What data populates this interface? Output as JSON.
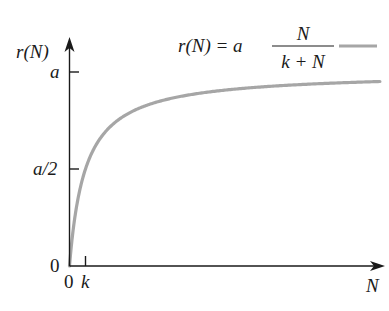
{
  "chart_data": {
    "type": "line",
    "title": "",
    "xlabel": "N",
    "ylabel": "r(N)",
    "equation": {
      "lhs": "r(N) = a",
      "numerator": "N",
      "denominator": "k + N"
    },
    "x_ticks": [
      {
        "value": 0,
        "label": "0"
      },
      {
        "value": 1,
        "label": "k"
      }
    ],
    "y_ticks": [
      {
        "value": 0,
        "label": "0"
      },
      {
        "value": 0.5,
        "label": "a/2"
      },
      {
        "value": 1,
        "label": "a"
      }
    ],
    "x_unit": "multiples of k",
    "y_unit": "fraction of a",
    "xlim": [
      0,
      19.5
    ],
    "ylim": [
      0,
      1.17
    ],
    "grid": false,
    "legend_position": "top-right",
    "series": [
      {
        "name": "r(N) = a N/(k + N)",
        "color": "#a6a6a6",
        "x": [
          0,
          0.25,
          0.5,
          1,
          2,
          3,
          4,
          6,
          8,
          10,
          12,
          15,
          19.4
        ],
        "y": [
          0,
          0.2,
          0.333,
          0.5,
          0.667,
          0.75,
          0.8,
          0.857,
          0.889,
          0.909,
          0.923,
          0.9375,
          0.951
        ]
      }
    ]
  },
  "axes": {
    "x_label": "N",
    "y_label": "r(N)",
    "origin_label_x": "0",
    "origin_label_y": "0",
    "k_label": "k",
    "half_label": "a/2",
    "a_label": "a"
  },
  "legend": {
    "lhs": "r(N) = a",
    "numerator": "N",
    "denominator": "k + N",
    "line_color": "#a6a6a6"
  }
}
